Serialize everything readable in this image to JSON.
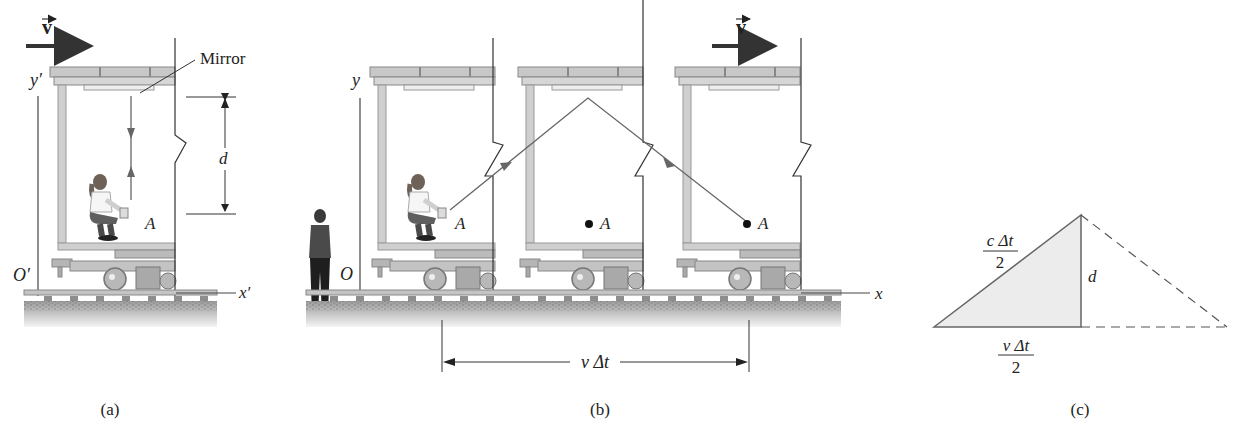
{
  "figure": {
    "panels": [
      {
        "id": "a",
        "caption": "(a)",
        "velocity_label": "v",
        "mirror_label": "Mirror",
        "y_axis_label": "y′",
        "origin_label": "O′",
        "x_axis_label": "x′",
        "distance_label": "d",
        "point_label": "A"
      },
      {
        "id": "b",
        "caption": "(b)",
        "velocity_label": "v",
        "y_axis_label": "y",
        "origin_label": "O",
        "x_axis_label": "x",
        "point_labels": [
          "A",
          "A",
          "A"
        ],
        "displacement_label": "v Δt"
      },
      {
        "id": "c",
        "caption": "(c)",
        "hypotenuse_numerator": "c Δt",
        "hypotenuse_denominator": "2",
        "height_label": "d",
        "base_numerator": "v Δt",
        "base_denominator": "2"
      }
    ]
  },
  "colors": {
    "line": "#555555",
    "light_path": "#666666",
    "car_body": "#cfcfcf",
    "car_frame": "#a8a8a8",
    "ground": "#bdbdbd",
    "triangle_fill": "#ececec"
  }
}
